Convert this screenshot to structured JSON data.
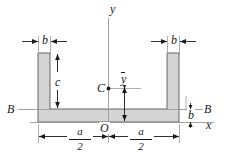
{
  "figure": {
    "type": "engineering-cross-section",
    "colors": {
      "section_fill": "#d4d4d4",
      "outline": "#4a4a4a",
      "dimension": "#1a1a1a",
      "axis": "#8c8c8c",
      "background": "#ffffff"
    }
  },
  "labels": {
    "axis_y": "y",
    "axis_x": "x",
    "origin": "O",
    "centroid": "C",
    "centroid_distance": "y",
    "flange_width_left": "b",
    "flange_width_right": "b",
    "web_height": "c",
    "base_thickness": "b",
    "section_left": "B",
    "section_right": "B",
    "half_width_left_num": "a",
    "half_width_left_den": "2",
    "half_width_right_num": "a",
    "half_width_right_den": "2"
  },
  "geometry": {
    "left_web_x": [
      38,
      50
    ],
    "right_web_x": [
      167,
      179
    ],
    "web_top_y": 53,
    "base_y": [
      109,
      122
    ],
    "y_axis_x": 108,
    "x_axis_y": 122,
    "bb_line_y": 109,
    "centroid_x": 108,
    "centroid_y": 88
  }
}
